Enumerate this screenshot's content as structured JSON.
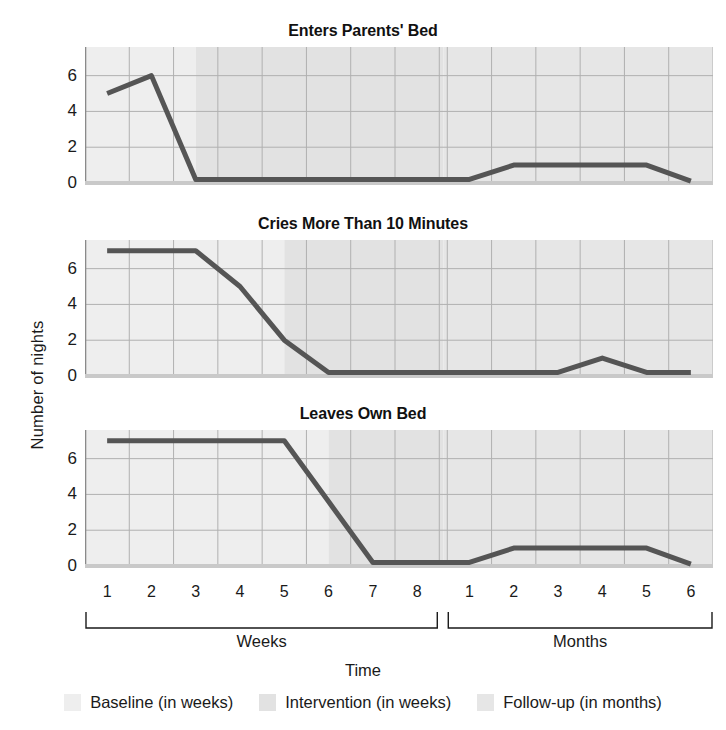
{
  "axes": {
    "ylabel": "Number of nights",
    "xlabel": "Time",
    "yticks": [
      "0",
      "2",
      "4",
      "6"
    ],
    "ytick_values": [
      0,
      2,
      4,
      6
    ],
    "ylim": [
      0,
      7.6
    ],
    "week_ticks": [
      "1",
      "2",
      "3",
      "4",
      "5",
      "6",
      "7",
      "8"
    ],
    "month_ticks": [
      "1",
      "2",
      "3",
      "4",
      "5",
      "6"
    ],
    "group_weeks": "Weeks",
    "group_months": "Months"
  },
  "legend": {
    "items": [
      {
        "label": "Baseline (in weeks)",
        "color": "#eeeeee",
        "swatch_name": "baseline-swatch"
      },
      {
        "label": "Intervention (in weeks)",
        "color": "#e2e2e2",
        "swatch_name": "intervention-swatch"
      },
      {
        "label": "Follow-up (in months)",
        "color": "#e6e6e6",
        "swatch_name": "followup-swatch"
      }
    ]
  },
  "style": {
    "line_color": "#555555",
    "grid_color": "#b0b0b0",
    "axis_color": "#8a8a8a",
    "baseline_fill": "#eeeeee",
    "intervention_fill": "#e2e2e2",
    "followup_fill": "#e6e6e6",
    "text_color": "#1a1a1a"
  },
  "chart_data": [
    {
      "type": "line",
      "title": "Enters Parents' Bed",
      "xlabel": "Time",
      "ylabel": "Number of nights",
      "ylim": [
        0,
        7.6
      ],
      "yticks": [
        0,
        2,
        4,
        6
      ],
      "grid": true,
      "legend_position": "bottom",
      "x": [
        "Week 1",
        "Week 2",
        "Week 3",
        "Week 4",
        "Week 5",
        "Week 6",
        "Week 7",
        "Week 8",
        "Month 1",
        "Month 2",
        "Month 3",
        "Month 4",
        "Month 5",
        "Month 6"
      ],
      "values": [
        5,
        6,
        0.2,
        0.2,
        0.2,
        0.2,
        0.2,
        0.2,
        0.2,
        1,
        1,
        1,
        1,
        0.1
      ],
      "phases": {
        "baseline": {
          "label": "Baseline (in weeks)",
          "x_start": "Week 1",
          "x_end": "Week 2.5"
        },
        "intervention": {
          "label": "Intervention (in weeks)",
          "x_start": "Week 2.5",
          "x_end": "Week 8.5"
        },
        "followup": {
          "label": "Follow-up (in months)",
          "x_start": "Month 0.5",
          "x_end": "Month 6"
        }
      }
    },
    {
      "type": "line",
      "title": "Cries More Than 10 Minutes",
      "xlabel": "Time",
      "ylabel": "Number of nights",
      "ylim": [
        0,
        7.6
      ],
      "yticks": [
        0,
        2,
        4,
        6
      ],
      "grid": true,
      "legend_position": "bottom",
      "x": [
        "Week 1",
        "Week 2",
        "Week 3",
        "Week 4",
        "Week 5",
        "Week 6",
        "Week 7",
        "Week 8",
        "Month 1",
        "Month 2",
        "Month 3",
        "Month 4",
        "Month 5",
        "Month 6"
      ],
      "values": [
        7,
        7,
        7,
        5,
        2,
        0.2,
        0.2,
        0.2,
        0.2,
        0.2,
        0.2,
        1,
        0.2,
        0.2
      ],
      "phases": {
        "baseline": {
          "label": "Baseline (in weeks)",
          "x_start": "Week 1",
          "x_end": "Week 4.5"
        },
        "intervention": {
          "label": "Intervention (in weeks)",
          "x_start": "Week 4.5",
          "x_end": "Week 8.5"
        },
        "followup": {
          "label": "Follow-up (in months)",
          "x_start": "Month 0.5",
          "x_end": "Month 6"
        }
      }
    },
    {
      "type": "line",
      "title": "Leaves Own Bed",
      "xlabel": "Time",
      "ylabel": "Number of nights",
      "ylim": [
        0,
        7.6
      ],
      "yticks": [
        0,
        2,
        4,
        6
      ],
      "grid": true,
      "legend_position": "bottom",
      "x": [
        "Week 1",
        "Week 2",
        "Week 3",
        "Week 4",
        "Week 5",
        "Week 6",
        "Week 7",
        "Week 8",
        "Month 1",
        "Month 2",
        "Month 3",
        "Month 4",
        "Month 5",
        "Month 6"
      ],
      "values": [
        7,
        7,
        7,
        7,
        7,
        3.6,
        0.2,
        0.2,
        0.2,
        1,
        1,
        1,
        1,
        0.1
      ],
      "phases": {
        "baseline": {
          "label": "Baseline (in weeks)",
          "x_start": "Week 1",
          "x_end": "Week 5.5"
        },
        "intervention": {
          "label": "Intervention (in weeks)",
          "x_start": "Week 5.5",
          "x_end": "Week 8.5"
        },
        "followup": {
          "label": "Follow-up (in months)",
          "x_start": "Month 0.5",
          "x_end": "Month 6"
        }
      }
    }
  ]
}
